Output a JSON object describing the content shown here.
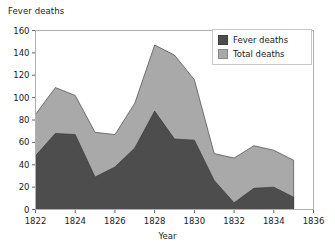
{
  "chart_data": {
    "type": "area",
    "title": "",
    "ylabel": "Fever deaths",
    "xlabel": "Year",
    "x": [
      1822,
      1823,
      1824,
      1825,
      1826,
      1827,
      1828,
      1829,
      1830,
      1831,
      1832,
      1833,
      1834,
      1835
    ],
    "xlim": [
      1822,
      1836
    ],
    "ylim": [
      0,
      160
    ],
    "xticks": [
      1822,
      1824,
      1826,
      1828,
      1830,
      1832,
      1834,
      1836
    ],
    "xtick_labels": [
      "1822",
      "1824",
      "1826",
      "1828",
      "1830",
      "1832",
      "1834",
      "1836"
    ],
    "yticks": [
      0,
      20,
      40,
      60,
      80,
      100,
      120,
      140,
      160
    ],
    "ytick_labels": [
      "0",
      "20",
      "40",
      "60",
      "80",
      "100",
      "120",
      "140",
      "160"
    ],
    "grid": false,
    "stacked": false,
    "legend_position": "top-right",
    "series": [
      {
        "name": "Fever deaths",
        "color": "#4d4d4d",
        "values": [
          48,
          68,
          67,
          29,
          38,
          55,
          88,
          63,
          62,
          26,
          6,
          19,
          20,
          11
        ]
      },
      {
        "name": "Total deaths",
        "color": "#a9a9a9",
        "values": [
          85,
          109,
          102,
          69,
          67,
          95,
          147,
          138,
          116,
          50,
          46,
          57,
          53,
          44
        ]
      }
    ]
  },
  "legend": {
    "items": [
      {
        "label": "Fever deaths",
        "color": "#4d4d4d"
      },
      {
        "label": "Total deaths",
        "color": "#a9a9a9"
      }
    ]
  },
  "axes": {
    "y_axis_title": "Fever deaths",
    "x_axis_title": "Year"
  }
}
